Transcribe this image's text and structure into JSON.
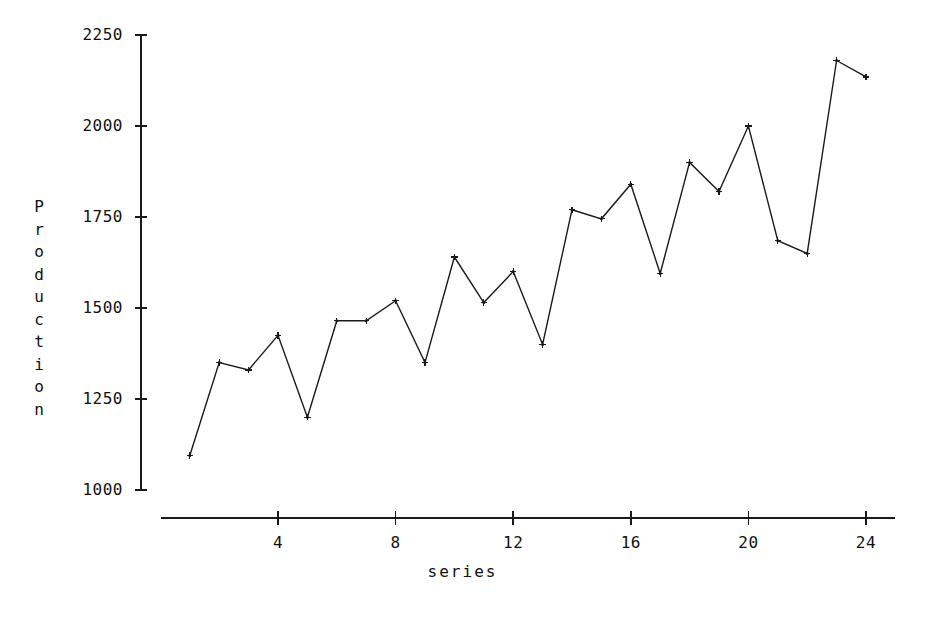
{
  "chart_data": {
    "type": "line",
    "title": "",
    "xlabel": "series",
    "ylabel": "Production",
    "x": [
      1,
      2,
      3,
      4,
      5,
      6,
      7,
      8,
      9,
      10,
      11,
      12,
      13,
      14,
      15,
      16,
      17,
      18,
      19,
      20,
      21,
      22,
      23,
      24
    ],
    "values": [
      1095,
      1350,
      1330,
      1425,
      1200,
      1465,
      1465,
      1520,
      1350,
      1640,
      1515,
      1600,
      1400,
      1770,
      1745,
      1840,
      1595,
      1900,
      1820,
      2000,
      1685,
      1650,
      2180,
      2135
    ],
    "series": [
      {
        "name": "Production",
        "values": [
          1095,
          1350,
          1330,
          1425,
          1200,
          1465,
          1465,
          1520,
          1350,
          1640,
          1515,
          1600,
          1400,
          1770,
          1745,
          1840,
          1595,
          1900,
          1820,
          2000,
          1685,
          1650,
          2180,
          2135
        ]
      }
    ],
    "xlim": [
      0.2,
      25.0
    ],
    "ylim": [
      1000,
      2250
    ],
    "xticks": [
      4,
      8,
      12,
      16,
      20,
      24
    ],
    "xtick_labels": [
      "4",
      "8",
      "12",
      "16",
      "20",
      "24"
    ],
    "yticks": [
      1000,
      1250,
      1500,
      1750,
      2000,
      2250
    ],
    "ytick_labels": [
      "1000",
      "1250",
      "1500",
      "1750",
      "2000",
      "2250"
    ],
    "grid": false,
    "legend": false,
    "marker": "cross-dot",
    "line_color": "#1a1a1a",
    "background_color": "#ffffff"
  },
  "axis_labels": {
    "y_letters": [
      "P",
      "r",
      "o",
      "d",
      "u",
      "c",
      "t",
      "i",
      "o",
      "n"
    ],
    "x_text": "series"
  }
}
